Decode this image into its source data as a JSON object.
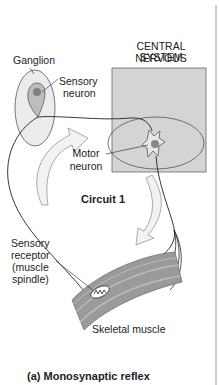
{
  "figure": {
    "caption": "(a) Monosynaptic reflex",
    "circuit_label": "Circuit 1"
  },
  "labels": {
    "ganglion": "Ganglion",
    "sensory_neuron_1": "Sensory",
    "sensory_neuron_2": "neuron",
    "cns_1": "CENTRAL NERVOUS",
    "cns_2": "SYSTEM",
    "motor_neuron_1": "Motor",
    "motor_neuron_2": "neuron",
    "receptor_1": "Sensory",
    "receptor_2": "receptor",
    "receptor_3": "(muscle",
    "receptor_4": "spindle)",
    "skeletal_muscle": "Skeletal muscle"
  },
  "colors": {
    "cns_box": "#d4d4d4",
    "ganglion_fill": "#ececec",
    "neuron_body": "#bdbdbd",
    "nucleus": "#808080",
    "muscle": "#9a9a9a",
    "arrow_fill": "#f2f2f2",
    "page_border": "#9a9a9a"
  }
}
